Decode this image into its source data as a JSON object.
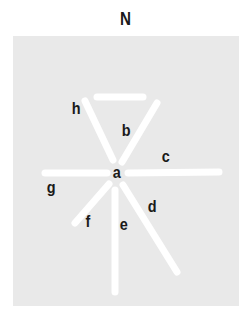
{
  "title": "N",
  "colors": {
    "background": "#ffffff",
    "panel": "#e9e9e9",
    "lines": "#ffffff",
    "text": "#1a1a1a"
  },
  "labels": {
    "a": "a",
    "b": "b",
    "c": "c",
    "d": "d",
    "e": "e",
    "f": "f",
    "g": "g",
    "h": "h"
  }
}
